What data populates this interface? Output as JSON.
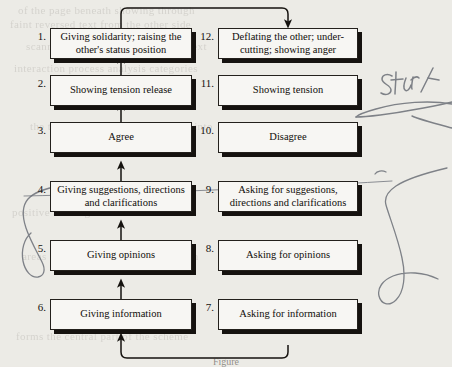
{
  "diagram": {
    "boxes": [
      {
        "number": "1.",
        "label": "Giving solidarity; raising the other's status position"
      },
      {
        "number": "2.",
        "label": "Showing tension release"
      },
      {
        "number": "3.",
        "label": "Agree"
      },
      {
        "number": "4.",
        "label": "Giving suggestions, directions and clarifications"
      },
      {
        "number": "5.",
        "label": "Giving opinions"
      },
      {
        "number": "6.",
        "label": "Giving information"
      },
      {
        "number": "7.",
        "label": "Asking for information"
      },
      {
        "number": "8.",
        "label": "Asking for opinions"
      },
      {
        "number": "9.",
        "label": "Asking for suggestions, directions and clarifications"
      },
      {
        "number": "10.",
        "label": "Disagree"
      },
      {
        "number": "11.",
        "label": "Showing tension"
      },
      {
        "number": "12.",
        "label": "Deflating the other; under-cutting; showing anger"
      }
    ],
    "annotations": [
      {
        "name": "handwritten-start-label",
        "text": "Start"
      }
    ],
    "ghost_text": [
      "of the page beneath showing through",
      "faint reversed text from the other side",
      "scanned book page bleed through text",
      "interaction process analysis categories",
      "the twelve categories are grouped into",
      "positive and negative socio-emotional",
      "areas and the neutral task area which",
      "forms the central part of the scheme"
    ],
    "caption": "Figure"
  },
  "colors": {
    "paper": "#ecebe6",
    "box_fill": "#f7f6f3",
    "ink": "#15120f",
    "pen": "#6b6f77"
  }
}
